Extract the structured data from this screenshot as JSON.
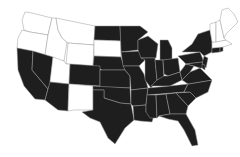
{
  "map": {
    "type": "us-states-choropleth",
    "fill_colors": {
      "selected": "#1e1e1e",
      "unselected": "#ffffff",
      "border": "#9a9a9a"
    },
    "states": [
      {
        "id": "WA",
        "name": "Washington",
        "filled": false
      },
      {
        "id": "OR",
        "name": "Oregon",
        "filled": false
      },
      {
        "id": "ID",
        "name": "Idaho",
        "filled": false
      },
      {
        "id": "MT",
        "name": "Montana",
        "filled": false
      },
      {
        "id": "WY",
        "name": "Wyoming",
        "filled": false
      },
      {
        "id": "SD",
        "name": "South Dakota",
        "filled": false
      },
      {
        "id": "UT",
        "name": "Utah",
        "filled": false
      },
      {
        "id": "NM",
        "name": "New Mexico",
        "filled": false
      },
      {
        "id": "ME",
        "name": "Maine",
        "filled": false
      },
      {
        "id": "NH",
        "name": "New Hampshire",
        "filled": false
      },
      {
        "id": "VT",
        "name": "Vermont",
        "filled": false
      },
      {
        "id": "MA",
        "name": "Massachusetts",
        "filled": false
      },
      {
        "id": "CA",
        "name": "California",
        "filled": true
      },
      {
        "id": "NV",
        "name": "Nevada",
        "filled": true
      },
      {
        "id": "AZ",
        "name": "Arizona",
        "filled": true
      },
      {
        "id": "CO",
        "name": "Colorado",
        "filled": true
      },
      {
        "id": "ND",
        "name": "North Dakota",
        "filled": true
      },
      {
        "id": "NE",
        "name": "Nebraska",
        "filled": true
      },
      {
        "id": "KS",
        "name": "Kansas",
        "filled": true
      },
      {
        "id": "OK",
        "name": "Oklahoma",
        "filled": true
      },
      {
        "id": "TX",
        "name": "Texas",
        "filled": true
      },
      {
        "id": "MN",
        "name": "Minnesota",
        "filled": true
      },
      {
        "id": "IA",
        "name": "Iowa",
        "filled": true
      },
      {
        "id": "MO",
        "name": "Missouri",
        "filled": true
      },
      {
        "id": "AR",
        "name": "Arkansas",
        "filled": true
      },
      {
        "id": "LA",
        "name": "Louisiana",
        "filled": true
      },
      {
        "id": "WI",
        "name": "Wisconsin",
        "filled": true
      },
      {
        "id": "IL",
        "name": "Illinois",
        "filled": true
      },
      {
        "id": "MI",
        "name": "Michigan",
        "filled": true
      },
      {
        "id": "IN",
        "name": "Indiana",
        "filled": true
      },
      {
        "id": "OH",
        "name": "Ohio",
        "filled": true
      },
      {
        "id": "KY",
        "name": "Kentucky",
        "filled": true
      },
      {
        "id": "TN",
        "name": "Tennessee",
        "filled": true
      },
      {
        "id": "MS",
        "name": "Mississippi",
        "filled": true
      },
      {
        "id": "AL",
        "name": "Alabama",
        "filled": true
      },
      {
        "id": "GA",
        "name": "Georgia",
        "filled": true
      },
      {
        "id": "FL",
        "name": "Florida",
        "filled": true
      },
      {
        "id": "SC",
        "name": "South Carolina",
        "filled": true
      },
      {
        "id": "NC",
        "name": "North Carolina",
        "filled": true
      },
      {
        "id": "VA",
        "name": "Virginia",
        "filled": true
      },
      {
        "id": "WV",
        "name": "West Virginia",
        "filled": true
      },
      {
        "id": "PA",
        "name": "Pennsylvania",
        "filled": true
      },
      {
        "id": "NY",
        "name": "New York",
        "filled": true
      },
      {
        "id": "NJ",
        "name": "New Jersey",
        "filled": true
      },
      {
        "id": "MD",
        "name": "Maryland",
        "filled": true
      },
      {
        "id": "DE",
        "name": "Delaware",
        "filled": true
      },
      {
        "id": "CT",
        "name": "Connecticut",
        "filled": true
      },
      {
        "id": "RI",
        "name": "Rhode Island",
        "filled": true
      }
    ]
  }
}
